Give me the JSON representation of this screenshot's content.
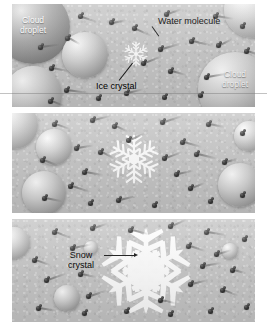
{
  "figure": {
    "background_color": "#c9c9c9",
    "molecule_color": "#2a2a2a",
    "crystal_color": "#ffffff",
    "label_color": "#000000",
    "droplet_label_color": "#ffffff"
  },
  "panels": [
    {
      "id": "panel-1",
      "name": "stage-1-ice-crystal-forms",
      "labels": [
        {
          "text": "Cloud droplet",
          "line1": "Cloud",
          "line2": "droplet",
          "kind": "droplet-label",
          "position": "top-left"
        },
        {
          "text": "Water molecule",
          "kind": "callout",
          "position": "top-right"
        },
        {
          "text": "Ice crystal",
          "kind": "callout",
          "position": "bottom-center"
        },
        {
          "text": "Cloud droplet",
          "line1": "Cloud",
          "line2": "droplet",
          "kind": "droplet-label",
          "position": "bottom-right"
        }
      ],
      "crystal_size": "small"
    },
    {
      "id": "panel-2",
      "name": "stage-2-crystal-grows",
      "labels": [],
      "crystal_size": "medium"
    },
    {
      "id": "panel-3",
      "name": "stage-3-snow-crystal",
      "labels": [
        {
          "text": "Snow crystal",
          "line1": "Snow",
          "line2": "crystal",
          "kind": "callout",
          "position": "center-left"
        }
      ],
      "crystal_size": "large"
    }
  ],
  "label_text": {
    "cloud_droplet_top_line1": "Cloud",
    "cloud_droplet_top_line2": "droplet",
    "cloud_droplet_right_line1": "Cloud",
    "cloud_droplet_right_line2": "droplet",
    "water_molecule": "Water molecule",
    "ice_crystal": "Ice crystal",
    "snow_crystal_line1": "Snow",
    "snow_crystal_line2": "crystal"
  }
}
